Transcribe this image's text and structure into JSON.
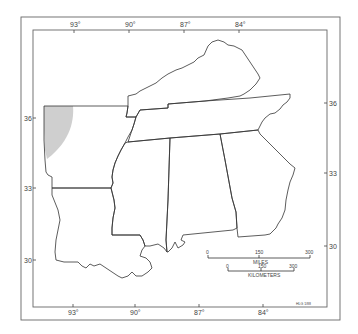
{
  "map": {
    "longitude_top": [
      {
        "label": "93°",
        "x": 74
      },
      {
        "label": "90°",
        "x": 129
      },
      {
        "label": "87°",
        "x": 184
      },
      {
        "label": "84°",
        "x": 239
      }
    ],
    "longitude_bottom": [
      {
        "label": "93°",
        "x": 73
      },
      {
        "label": "90°",
        "x": 135
      },
      {
        "label": "87°",
        "x": 199
      },
      {
        "label": "84°",
        "x": 263
      }
    ],
    "latitude_left": [
      {
        "label": "36",
        "y": 118
      },
      {
        "label": "33",
        "y": 188
      },
      {
        "label": "30",
        "y": 260
      }
    ],
    "latitude_right": [
      {
        "label": "36",
        "y": 103
      },
      {
        "label": "33",
        "y": 173
      },
      {
        "label": "30",
        "y": 246
      }
    ],
    "scale": {
      "miles_label": "MILES",
      "miles_ticks": [
        "0",
        "150",
        "300"
      ],
      "km_label": "KILOMETERS",
      "km_ticks": [
        "0",
        "150",
        "300"
      ]
    },
    "credit": "HLG 1/88",
    "shaded_region_color": "#cfcfcf"
  }
}
